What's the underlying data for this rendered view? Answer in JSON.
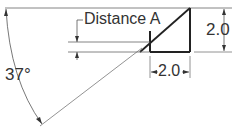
{
  "diagram": {
    "labels": {
      "distance": "Distance A",
      "angle": "37°",
      "height_dim": "2.0",
      "width_dim": "2.0"
    },
    "colors": {
      "line": "#333333",
      "thin_line": "#555555"
    }
  }
}
